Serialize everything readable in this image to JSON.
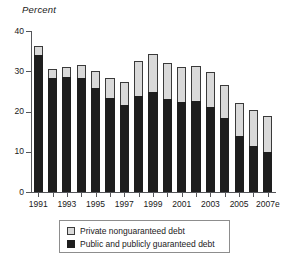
{
  "chart_data": {
    "type": "bar",
    "subtype": "stacked-vertical",
    "title": "",
    "ylabel": "Percent",
    "xlabel": "",
    "ylim": [
      0,
      40
    ],
    "yticks": [
      0,
      10,
      20,
      30,
      40
    ],
    "ytick_labels": [
      "0",
      "10",
      "20",
      "30",
      "40"
    ],
    "grid": false,
    "legend_position": "below-axes",
    "categories": [
      "1991",
      "1992",
      "1993",
      "1994",
      "1995",
      "1996",
      "1997",
      "1998",
      "1999",
      "2000",
      "2001",
      "2002",
      "2003",
      "2004",
      "2005",
      "2006",
      "2007e"
    ],
    "xtick_labels_shown": [
      "1991",
      "",
      "1993",
      "",
      "1995",
      "",
      "1997",
      "",
      "1999",
      "",
      "2001",
      "",
      "2003",
      "",
      "2005",
      "",
      "2007e"
    ],
    "series": [
      {
        "name": "Public and publicly guaranteed debt",
        "color": "#1e1e1e",
        "values": [
          34.0,
          28.2,
          28.5,
          28.2,
          25.8,
          23.4,
          21.6,
          23.8,
          24.8,
          23.0,
          22.3,
          22.5,
          21.2,
          18.5,
          14.0,
          11.5,
          10.0
        ]
      },
      {
        "name": "Private nonguaranteed debt",
        "color": "#d9d9d9",
        "values": [
          2.2,
          2.3,
          2.6,
          3.4,
          4.2,
          5.0,
          5.8,
          8.7,
          9.4,
          9.0,
          8.8,
          8.9,
          8.5,
          8.1,
          8.2,
          8.8,
          9.0
        ]
      }
    ],
    "totals": [
      36.2,
      30.5,
      31.1,
      31.6,
      30.0,
      28.4,
      27.4,
      32.5,
      34.2,
      32.0,
      31.1,
      31.4,
      29.7,
      26.6,
      22.2,
      20.3,
      19.0
    ]
  },
  "legend": {
    "items": [
      {
        "label": "Private nonguaranteed debt",
        "swatch": "private"
      },
      {
        "label": "Public and publicly guaranteed debt",
        "swatch": "public"
      }
    ]
  }
}
